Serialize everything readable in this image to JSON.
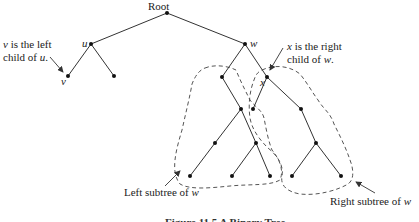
{
  "diagram": {
    "nodes": [
      {
        "id": "root",
        "label": "Root"
      },
      {
        "id": "u",
        "label": "u"
      },
      {
        "id": "w",
        "label": "w"
      },
      {
        "id": "v",
        "label": "v"
      },
      {
        "id": "u_right",
        "label": ""
      },
      {
        "id": "w_left",
        "label": ""
      },
      {
        "id": "x",
        "label": "x"
      },
      {
        "id": "a",
        "label": ""
      },
      {
        "id": "b",
        "label": ""
      },
      {
        "id": "c",
        "label": ""
      },
      {
        "id": "b_left",
        "label": ""
      },
      {
        "id": "c_left",
        "label": ""
      },
      {
        "id": "c_right",
        "label": ""
      },
      {
        "id": "x_left",
        "label": ""
      },
      {
        "id": "x_right",
        "label": ""
      },
      {
        "id": "d",
        "label": ""
      },
      {
        "id": "d_left",
        "label": ""
      },
      {
        "id": "d_right",
        "label": ""
      }
    ],
    "edges": [
      [
        "root",
        "u"
      ],
      [
        "root",
        "w"
      ],
      [
        "u",
        "v"
      ],
      [
        "u",
        "u_right"
      ],
      [
        "w",
        "w_left"
      ],
      [
        "w",
        "x"
      ],
      [
        "w_left",
        "a"
      ],
      [
        "a",
        "b"
      ],
      [
        "a",
        "c"
      ],
      [
        "b",
        "b_left"
      ],
      [
        "c",
        "c_left"
      ],
      [
        "c",
        "c_right"
      ],
      [
        "x",
        "x_left"
      ],
      [
        "x",
        "x_right"
      ],
      [
        "x_right",
        "d"
      ],
      [
        "d",
        "d_left"
      ],
      [
        "d",
        "d_right"
      ]
    ],
    "annotations": {
      "v_left_line1": "v is the left",
      "v_left_line2_prefix": "child of ",
      "v_left_line2_var": "u",
      "v_left_line2_suffix": ".",
      "x_right_line1_var": "x",
      "x_right_line1_suffix": " is the right",
      "x_right_line2_prefix": "child of ",
      "x_right_line2_var": "w",
      "x_right_line2_suffix": ".",
      "left_subtree_prefix": "Left subtree of ",
      "left_subtree_var": "w",
      "right_subtree_prefix": "Right subtree of ",
      "right_subtree_var": "w"
    },
    "caption": "Figure 11.5 A Binary Tree"
  }
}
